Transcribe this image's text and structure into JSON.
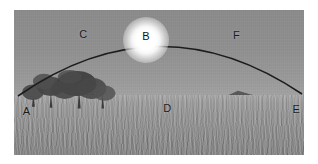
{
  "diagram": {
    "type": "annotated-photograph",
    "border_color": "#ffffff",
    "sky_color": "#8f8f8f",
    "ground_color": "#999999",
    "arc_color": "#1a1a1a",
    "sun_color": "#ffffff",
    "labels": [
      {
        "id": "A",
        "text": "A",
        "role": "arc-left-endpoint-horizon",
        "x_pct": 3.0,
        "y_pct": 66.0
      },
      {
        "id": "B",
        "text": "B",
        "role": "sun-at-top-of-arc",
        "x_pct": 45.5,
        "y_pct": 14.5
      },
      {
        "id": "C",
        "text": "C",
        "role": "arc-segment-left",
        "x_pct": 22.5,
        "y_pct": 13.0
      },
      {
        "id": "D",
        "text": "D",
        "role": "distant-hills-horizon",
        "x_pct": 51.5,
        "y_pct": 64.0
      },
      {
        "id": "E",
        "text": "E",
        "role": "arc-right-endpoint-horizon",
        "x_pct": 96.0,
        "y_pct": 64.5
      },
      {
        "id": "F",
        "text": "F",
        "role": "arc-segment-right",
        "x_pct": 75.5,
        "y_pct": 13.5
      }
    ],
    "features": {
      "trees": "tree-cluster-left",
      "hills": "distant-hill-ridge",
      "grass": "tall-grass-field-foreground",
      "arc": "sun-path-arc",
      "sun": "sun-disc-glow"
    }
  }
}
